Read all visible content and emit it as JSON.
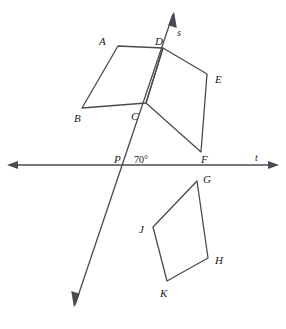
{
  "figure": {
    "width": 286,
    "height": 329,
    "background": "#ffffff",
    "stroke_color": "#4a4a52",
    "stroke_width": 1.3,
    "text_color": "#1a1a1a"
  },
  "lines": {
    "s": {
      "label": "s",
      "label_x": 177,
      "label_y": 28,
      "x1": 173,
      "y1": 14,
      "x2": 75,
      "y2": 305,
      "arrow_start": true,
      "arrow_end": true
    },
    "t": {
      "label": "t",
      "label_x": 255,
      "label_y": 153,
      "x1": 9,
      "y1": 165,
      "x2": 277,
      "y2": 165,
      "arrow_start": true,
      "arrow_end": true
    }
  },
  "angle": {
    "value": "70°",
    "x": 134,
    "y": 155
  },
  "points": [
    {
      "id": "A",
      "label": "A",
      "x": 118,
      "y": 46,
      "label_x": 99,
      "label_y": 36
    },
    {
      "id": "B",
      "label": "B",
      "x": 82,
      "y": 108,
      "label_x": 74,
      "label_y": 113
    },
    {
      "id": "C",
      "label": "C",
      "x": 146,
      "y": 103,
      "label_x": 131,
      "label_y": 111
    },
    {
      "id": "D",
      "label": "D",
      "x": 163,
      "y": 48,
      "label_x": 155,
      "label_y": 36
    },
    {
      "id": "E",
      "label": "E",
      "x": 207,
      "y": 74,
      "label_x": 215,
      "label_y": 74
    },
    {
      "id": "F",
      "label": "F",
      "x": 201,
      "y": 152,
      "label_x": 201,
      "label_y": 154
    },
    {
      "id": "G",
      "label": "G",
      "x": 197,
      "y": 181,
      "label_x": 203,
      "label_y": 174
    },
    {
      "id": "H",
      "label": "H",
      "x": 208,
      "y": 258,
      "label_x": 215,
      "label_y": 255
    },
    {
      "id": "J",
      "label": "J",
      "x": 153,
      "y": 227,
      "label_x": 139,
      "label_y": 224
    },
    {
      "id": "K",
      "label": "K",
      "x": 167,
      "y": 281,
      "label_x": 160,
      "label_y": 288
    },
    {
      "id": "P",
      "label": "P",
      "x": 127,
      "y": 165,
      "label_x": 114,
      "label_y": 154
    }
  ],
  "shapes": [
    {
      "name": "quadrilateral-ABCD",
      "vertices": "A,B,C,D",
      "path": "118,46 82,108 146,103 163,48"
    },
    {
      "name": "quadrilateral-DEFC",
      "vertices": "D,E,F,C",
      "path": "163,48 207,74 201,152 146,103"
    },
    {
      "name": "quadrilateral-GHKJ",
      "vertices": "G,H,K,J",
      "path": "197,181 208,258 167,281 153,227"
    }
  ]
}
